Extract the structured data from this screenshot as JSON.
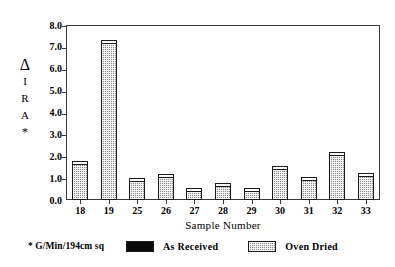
{
  "chart_data": {
    "type": "bar",
    "title": "",
    "xlabel": "Sample Number",
    "ylabel": "Δ IRA *",
    "ylabel_glyphs": [
      "Δ",
      "I",
      "R",
      "A",
      "*"
    ],
    "categories": [
      "18",
      "19",
      "25",
      "26",
      "27",
      "28",
      "29",
      "30",
      "31",
      "32",
      "33"
    ],
    "ylim": [
      0.0,
      8.0
    ],
    "yticks": [
      "0.0",
      "1.0",
      "2.0",
      "3.0",
      "4.0",
      "5.0",
      "6.0",
      "7.0",
      "8.0"
    ],
    "ytick_values": [
      0.0,
      1.0,
      2.0,
      3.0,
      4.0,
      5.0,
      6.0,
      7.0,
      8.0
    ],
    "grid": false,
    "legend_position": "bottom",
    "series": [
      {
        "name": "As Received",
        "color": "#0a0a0a",
        "values": [
          0,
          0,
          0,
          0,
          0,
          0,
          0,
          0,
          0,
          0,
          0
        ]
      },
      {
        "name": "Oven Dried",
        "color": "#8d8d8d",
        "values": [
          1.65,
          7.2,
          0.85,
          1.05,
          0.4,
          0.65,
          0.4,
          1.4,
          0.9,
          2.05,
          1.1
        ]
      }
    ]
  },
  "legend": {
    "footnote": "* G/Min/194cm sq",
    "entries": [
      {
        "label": "As Received"
      },
      {
        "label": "Oven Dried"
      }
    ]
  },
  "colors": {
    "as_received": "#0a0a0a",
    "oven_dried": "#8d8d8d",
    "axis": "#3a3a3a",
    "background": "#ffffff"
  }
}
